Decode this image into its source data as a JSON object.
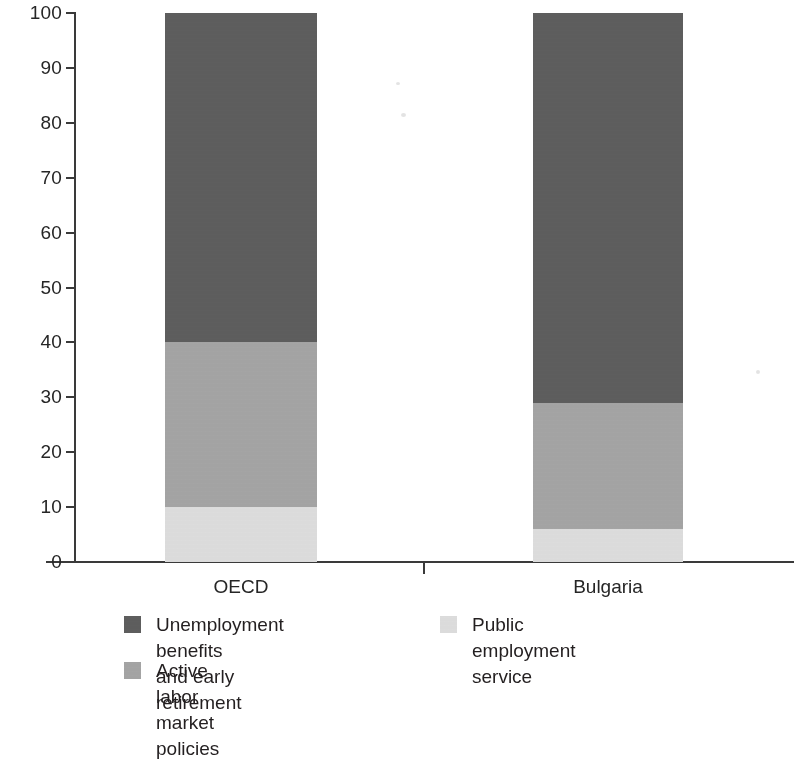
{
  "chart_data": {
    "type": "bar",
    "subtype": "stacked-100-percent",
    "title": "",
    "subtitle": "",
    "xlabel": "",
    "ylabel": "",
    "categories": [
      "OECD",
      "Bulgaria"
    ],
    "ylim": [
      0,
      100
    ],
    "ytick_labels": [
      "100",
      "90",
      "80",
      "70",
      "60",
      "50",
      "40",
      "30",
      "20",
      "10",
      "0"
    ],
    "ytick_values": [
      100,
      90,
      80,
      70,
      60,
      50,
      40,
      30,
      20,
      10,
      0
    ],
    "grid": false,
    "legend_position": "bottom",
    "series": [
      {
        "name": "Unemployment benefits and early retirement",
        "color": "#606060",
        "values": [
          60,
          71
        ]
      },
      {
        "name": "Active labor market policies",
        "color": "#a8a8a8",
        "values": [
          30,
          23
        ]
      },
      {
        "name": "Public employment service",
        "color": "#e2e2e2",
        "values": [
          10,
          6
        ]
      }
    ],
    "stack_boundaries": {
      "OECD": [
        0,
        10,
        40,
        100
      ],
      "Bulgaria": [
        0,
        6,
        29,
        100
      ]
    }
  },
  "axis": {
    "y_ticks": [
      {
        "label": "100",
        "value": 100
      },
      {
        "label": "90",
        "value": 90
      },
      {
        "label": "80",
        "value": 80
      },
      {
        "label": "70",
        "value": 70
      },
      {
        "label": "60",
        "value": 60
      },
      {
        "label": "50",
        "value": 50
      },
      {
        "label": "40",
        "value": 40
      },
      {
        "label": "30",
        "value": 30
      },
      {
        "label": "20",
        "value": 20
      },
      {
        "label": "10",
        "value": 10
      },
      {
        "label": "0",
        "value": 0
      }
    ],
    "x_labels": [
      "OECD",
      "Bulgaria"
    ]
  },
  "legend": {
    "items": [
      {
        "label": "Unemployment benefits\nand early retirement",
        "color": "#606060"
      },
      {
        "label": "Public employment service",
        "color": "#e2e2e2"
      },
      {
        "label": "Active labor market policies",
        "color": "#a8a8a8"
      }
    ]
  },
  "colors": {
    "dark_gray": "#606060",
    "mid_gray": "#a8a8a8",
    "light_gray": "#e2e2e2",
    "axis": "#3a3a3a",
    "text": "#231f20",
    "background": "#ffffff"
  }
}
